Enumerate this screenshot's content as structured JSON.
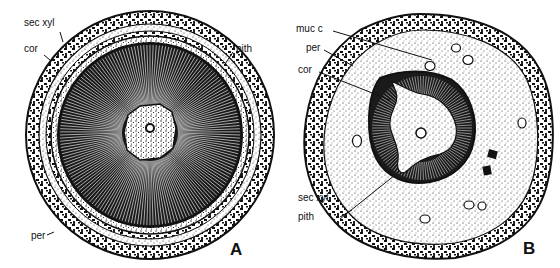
{
  "figure": {
    "panels": [
      {
        "id": "A",
        "letter": "A",
        "labels": [
          {
            "key": "sec_xyl",
            "text": "sec xyl"
          },
          {
            "key": "cor",
            "text": "cor"
          },
          {
            "key": "pith",
            "text": "pith"
          },
          {
            "key": "per",
            "text": "per"
          }
        ]
      },
      {
        "id": "B",
        "letter": "B",
        "labels": [
          {
            "key": "muc_c",
            "text": "muc c"
          },
          {
            "key": "per",
            "text": "per"
          },
          {
            "key": "cor",
            "text": "cor"
          },
          {
            "key": "sec_xyl",
            "text": "sec xyl"
          },
          {
            "key": "pith",
            "text": "pith"
          }
        ]
      }
    ],
    "colors": {
      "ink": "#111111",
      "paper": "#ffffff",
      "stipple_light": "#f2f2f2"
    }
  }
}
